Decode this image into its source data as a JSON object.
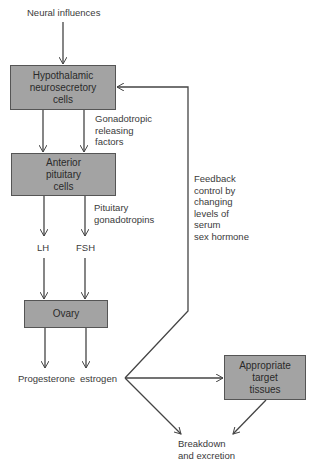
{
  "diagram": {
    "title_input": "Neural influences",
    "boxes": {
      "hypothalamic": "Hypothalamic\nneurosecretory\ncells",
      "pituitary": "Anterior\npituitary\ncells",
      "ovary": "Ovary",
      "target": "Appropriate\ntarget\ntissues"
    },
    "labels": {
      "releasing_factors": "Gonadotropic\nreleasing\nfactors",
      "gonadotropins": "Pituitary\ngonadotropins",
      "lh": "LH",
      "fsh": "FSH",
      "progesterone": "Progesterone",
      "estrogen": "estrogen",
      "feedback": "Feedback\ncontrol by\nchanging\nlevels of\nserum\nsex hormone",
      "breakdown": "Breakdown\nand excretion"
    },
    "colors": {
      "box_fill": "#a3a3a3",
      "line": "#444444"
    }
  }
}
